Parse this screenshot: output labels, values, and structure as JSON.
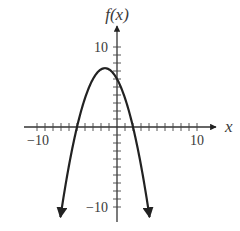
{
  "chart_data": {
    "type": "line",
    "title": "",
    "xlabel": "x",
    "ylabel": "f(x)",
    "xlim": [
      -10,
      10
    ],
    "ylim": [
      -10,
      10
    ],
    "x_tick_step": 1,
    "y_tick_step": 1,
    "x_tick_labels": [
      {
        "value": -10,
        "label": "−10"
      },
      {
        "value": 10,
        "label": "10"
      }
    ],
    "y_tick_labels": [
      {
        "value": 10,
        "label": "10"
      },
      {
        "value": -10,
        "label": "−10"
      }
    ],
    "grid": false,
    "legend": null,
    "series": [
      {
        "name": "f(x)",
        "description": "Downward-opening parabola, arrows at both ends",
        "equation": "f(x) = -0.6(x + 5)(x - 2)",
        "vertex": [
          -1.5,
          7.35
        ],
        "x_intercepts": [
          -5,
          2
        ],
        "y_intercept": 6,
        "x_range": [
          -7.07,
          4.07
        ],
        "color": "#222222"
      }
    ]
  },
  "labels": {
    "y_axis": "f(x)",
    "x_axis": "x",
    "x_min": "−10",
    "x_max": "10",
    "y_max": "10",
    "y_min": "−10"
  }
}
